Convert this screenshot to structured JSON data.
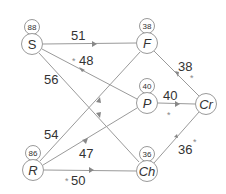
{
  "diagram": {
    "type": "network-flow",
    "nodes": [
      {
        "id": "S",
        "label": "S",
        "italic": true,
        "weight": "88",
        "x": 32,
        "y": 44
      },
      {
        "id": "F",
        "label": "F",
        "italic": true,
        "weight": "38",
        "x": 147,
        "y": 43
      },
      {
        "id": "P",
        "label": "P",
        "italic": true,
        "weight": "40",
        "x": 147,
        "y": 103
      },
      {
        "id": "Cr",
        "label": "Cr",
        "italic": true,
        "weight": "",
        "x": 206,
        "y": 104
      },
      {
        "id": "R",
        "label": "R",
        "italic": true,
        "weight": "86",
        "x": 33,
        "y": 170
      },
      {
        "id": "Ch",
        "label": "Ch",
        "italic": true,
        "weight": "36",
        "x": 147,
        "y": 171
      }
    ],
    "edges": [
      {
        "from": "S",
        "to": "F",
        "label": "51",
        "starred": false
      },
      {
        "from": "S",
        "to": "P",
        "label": "48",
        "starred": true
      },
      {
        "from": "S",
        "to": "Ch",
        "label": "56",
        "starred": false
      },
      {
        "from": "R",
        "to": "F",
        "label": "54",
        "starred": false
      },
      {
        "from": "R",
        "to": "P",
        "label": "47",
        "starred": false
      },
      {
        "from": "R",
        "to": "Ch",
        "label": "50",
        "starred": true
      },
      {
        "from": "F",
        "to": "Cr",
        "label": "38",
        "starred": true
      },
      {
        "from": "P",
        "to": "Cr",
        "label": "40",
        "starred": true
      },
      {
        "from": "Ch",
        "to": "Cr",
        "label": "36",
        "starred": true
      }
    ],
    "colors": {
      "line": "#9a9a9a",
      "text": "#333333",
      "arrow": "#888888",
      "background": "#ffffff"
    }
  }
}
